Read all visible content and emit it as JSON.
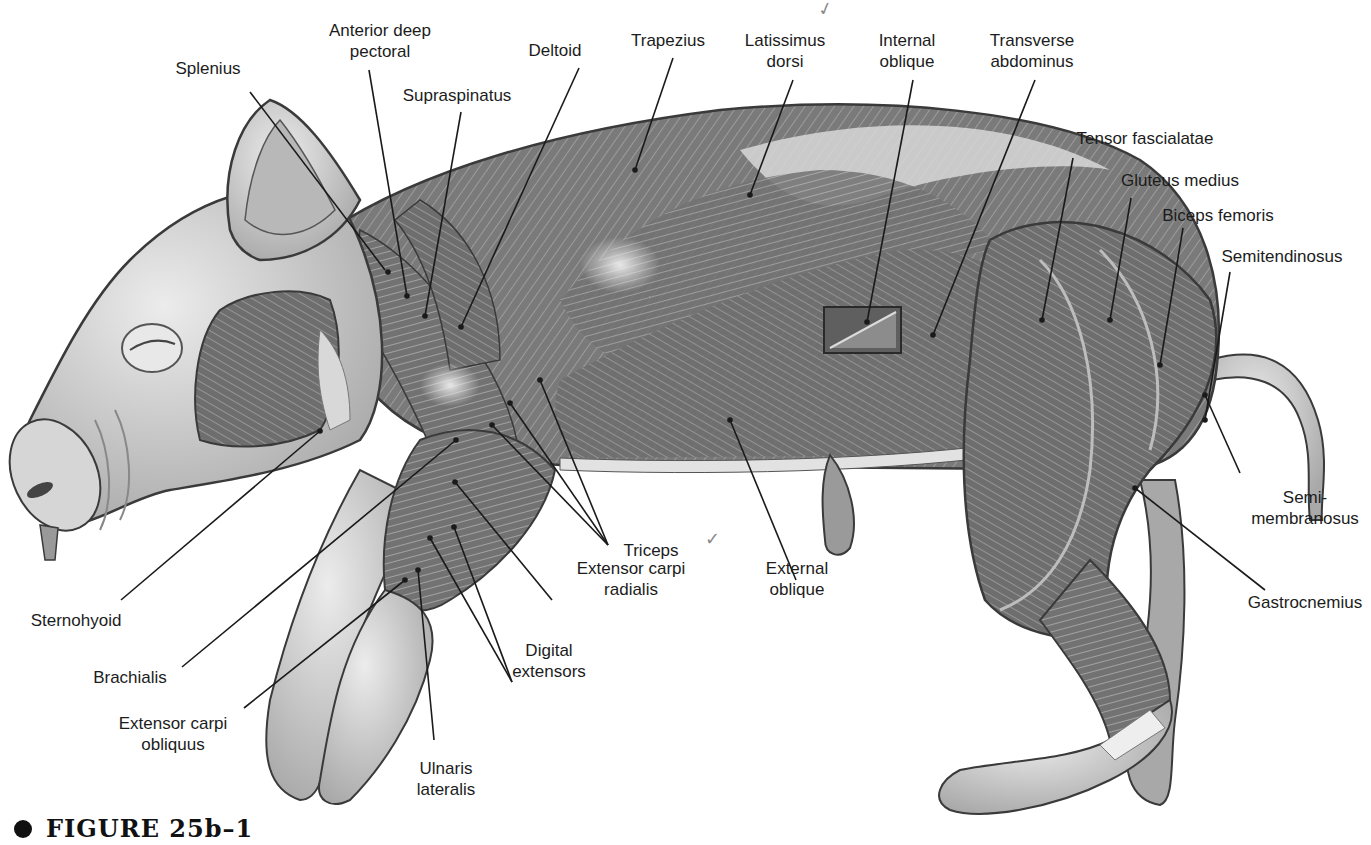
{
  "figure": {
    "caption_bullet": "●",
    "caption": "FIGURE 25b–1"
  },
  "labels": [
    {
      "id": "splenius",
      "text": "Splenius",
      "x": 208,
      "y": 58,
      "line": [
        [
          250,
          92
        ],
        [
          385,
          270
        ]
      ],
      "dot": [
        388,
        272
      ]
    },
    {
      "id": "anterior-deep-pectoral",
      "text": "Anterior deep\npectoral",
      "x": 380,
      "y": 20,
      "line": [
        [
          369,
          70
        ],
        [
          407,
          296
        ]
      ],
      "dot": [
        407,
        296
      ]
    },
    {
      "id": "supraspinatus",
      "text": "Supraspinatus",
      "x": 457,
      "y": 85,
      "line": [
        [
          461,
          112
        ],
        [
          425,
          316
        ]
      ],
      "dot": [
        425,
        316
      ]
    },
    {
      "id": "deltoid",
      "text": "Deltoid",
      "x": 555,
      "y": 40,
      "line": [
        [
          579,
          68
        ],
        [
          461,
          327
        ]
      ],
      "dot": [
        461,
        327
      ]
    },
    {
      "id": "trapezius",
      "text": "Trapezius",
      "x": 668,
      "y": 30,
      "line": [
        [
          673,
          58
        ],
        [
          635,
          170
        ]
      ],
      "dot": [
        635,
        170
      ]
    },
    {
      "id": "latissimus-dorsi",
      "text": "Latissimus\ndorsi",
      "x": 785,
      "y": 30,
      "line": [
        [
          793,
          80
        ],
        [
          750,
          195
        ]
      ],
      "dot": [
        750,
        195
      ]
    },
    {
      "id": "internal-oblique",
      "text": "Internal\noblique",
      "x": 907,
      "y": 30,
      "line": [
        [
          913,
          80
        ],
        [
          867,
          322
        ]
      ],
      "dot": [
        867,
        322
      ]
    },
    {
      "id": "transverse-abdominus",
      "text": "Transverse\nabdominus",
      "x": 1032,
      "y": 30,
      "line": [
        [
          1035,
          80
        ],
        [
          933,
          335
        ]
      ],
      "dot": [
        933,
        335
      ]
    },
    {
      "id": "tensor-fascialatae",
      "text": "Tensor fascialatae",
      "x": 1145,
      "y": 128,
      "line": [
        [
          1073,
          158
        ],
        [
          1042,
          320
        ]
      ],
      "dot": [
        1042,
        320
      ]
    },
    {
      "id": "gluteus-medius",
      "text": "Gluteus medius",
      "x": 1180,
      "y": 170,
      "line": [
        [
          1131,
          198
        ],
        [
          1110,
          320
        ]
      ],
      "dot": [
        1110,
        320
      ]
    },
    {
      "id": "biceps-femoris",
      "text": "Biceps femoris",
      "x": 1218,
      "y": 205,
      "line": [
        [
          1183,
          228
        ],
        [
          1160,
          365
        ]
      ],
      "dot": [
        1160,
        365
      ]
    },
    {
      "id": "semitendinosus",
      "text": "Semitendinosus",
      "x": 1282,
      "y": 246,
      "line": [
        [
          1230,
          272
        ],
        [
          1205,
          420
        ]
      ],
      "dot": [
        1205,
        420
      ]
    },
    {
      "id": "semimembranosus",
      "text": "Semi-\nmembranosus",
      "x": 1305,
      "y": 487,
      "line": [
        [
          1240,
          473
        ],
        [
          1205,
          395
        ]
      ],
      "dot": [
        1205,
        395
      ]
    },
    {
      "id": "gastrocnemius",
      "text": "Gastrocnemius",
      "x": 1305,
      "y": 592,
      "line": [
        [
          1265,
          590
        ],
        [
          1135,
          488
        ]
      ],
      "dot": [
        1135,
        488
      ]
    },
    {
      "id": "triceps",
      "text": "Triceps",
      "x": 651,
      "y": 540,
      "lines": [
        [
          [
            608,
            545
          ],
          [
            492,
            425
          ]
        ],
        [
          [
            608,
            545
          ],
          [
            510,
            403
          ]
        ],
        [
          [
            608,
            545
          ],
          [
            540,
            380
          ]
        ]
      ],
      "dot_list": [
        [
          492,
          425
        ],
        [
          510,
          403
        ],
        [
          540,
          380
        ]
      ]
    },
    {
      "id": "extensor-carpi-radialis",
      "text": "Extensor carpi\nradialis",
      "x": 631,
      "y": 558,
      "line": [
        [
          552,
          600
        ],
        [
          455,
          482
        ]
      ],
      "dot": [
        455,
        482
      ]
    },
    {
      "id": "external-oblique",
      "text": "External\noblique",
      "x": 797,
      "y": 558,
      "line": [
        [
          796,
          580
        ],
        [
          730,
          420
        ]
      ],
      "dot": [
        730,
        420
      ]
    },
    {
      "id": "digital-extensors",
      "text": "Digital\nextensors",
      "x": 549,
      "y": 640,
      "lines": [
        [
          [
            512,
            682
          ],
          [
            430,
            538
          ]
        ],
        [
          [
            512,
            682
          ],
          [
            454,
            527
          ]
        ]
      ],
      "dot_list": [
        [
          430,
          538
        ],
        [
          454,
          527
        ]
      ]
    },
    {
      "id": "ulnaris-lateralis",
      "text": "Ulnaris\nlateralis",
      "x": 446,
      "y": 758,
      "line": [
        [
          434,
          740
        ],
        [
          418,
          570
        ]
      ],
      "dot": [
        418,
        570
      ]
    },
    {
      "id": "sternohyoid",
      "text": "Sternohyoid",
      "x": 76,
      "y": 610,
      "line": [
        [
          121,
          600
        ],
        [
          320,
          431
        ]
      ],
      "dot": [
        320,
        431
      ]
    },
    {
      "id": "brachialis",
      "text": "Brachialis",
      "x": 130,
      "y": 667,
      "line": [
        [
          182,
          667
        ],
        [
          456,
          440
        ]
      ],
      "dot": [
        456,
        440
      ]
    },
    {
      "id": "extensor-carpi-obliquus",
      "text": "Extensor carpi\nobliquus",
      "x": 173,
      "y": 713,
      "line": [
        [
          244,
          708
        ],
        [
          405,
          580
        ]
      ],
      "dot": [
        405,
        580
      ]
    }
  ],
  "annotations": {
    "triceps_check": "✓",
    "top_check": "✓"
  },
  "colors": {
    "background": "#ffffff",
    "skin": "#c9c9c9",
    "skin_light": "#e4e4e4",
    "muscle": "#7a7a7a",
    "muscle_dark": "#5a5a5a",
    "outline": "#3a3a3a",
    "leader": "#1a1a1a"
  }
}
